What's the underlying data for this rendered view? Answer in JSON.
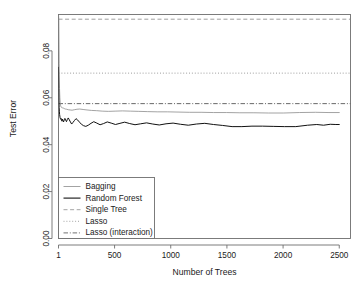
{
  "chart_data": {
    "type": "line",
    "title": "",
    "xlabel": "Number of Trees",
    "ylabel": "Test Error",
    "xlim": [
      1,
      2600
    ],
    "ylim": [
      0.0,
      0.0955
    ],
    "grid": false,
    "legend_position": "bottom-left",
    "xticks": [
      1,
      500,
      1000,
      1500,
      2000,
      2500
    ],
    "xticklabels": [
      "1",
      "500",
      "1000",
      "1500",
      "2000",
      "2500"
    ],
    "yticks": [
      0.0,
      0.02,
      0.04,
      0.06,
      0.08
    ],
    "yticklabels": [
      "0.00",
      "0.02",
      "0.04",
      "0.06",
      "0.08"
    ],
    "series": [
      {
        "name": "Bagging",
        "style": "solid",
        "color": "#8c8c8c",
        "linewidth": 0.8,
        "x": [
          1,
          4,
          7,
          10,
          13,
          16,
          20,
          25,
          30,
          36,
          44,
          52,
          62,
          74,
          88,
          104,
          122,
          142,
          165,
          190,
          220,
          255,
          295,
          340,
          390,
          445,
          505,
          570,
          640,
          715,
          795,
          880,
          970,
          1065,
          1165,
          1270,
          1380,
          1495,
          1615,
          1740,
          1870,
          2005,
          2145,
          2290,
          2400,
          2500
        ],
        "y": [
          0.0955,
          0.0932,
          0.0745,
          0.064,
          0.06,
          0.0578,
          0.0566,
          0.056,
          0.0558,
          0.0557,
          0.0556,
          0.0554,
          0.0552,
          0.0551,
          0.0549,
          0.0548,
          0.0547,
          0.0549,
          0.0551,
          0.0552,
          0.055,
          0.0548,
          0.0546,
          0.0545,
          0.0543,
          0.0542,
          0.0543,
          0.0544,
          0.0543,
          0.0542,
          0.0541,
          0.054,
          0.054,
          0.0539,
          0.0538,
          0.0538,
          0.0537,
          0.0537,
          0.0536,
          0.0536,
          0.0535,
          0.0535,
          0.0537,
          0.0538,
          0.0537,
          0.0537
        ]
      },
      {
        "name": "Random Forest",
        "style": "solid",
        "color": "#111111",
        "linewidth": 1.0,
        "x": [
          1,
          3,
          5,
          7,
          9,
          11,
          13,
          15,
          18,
          21,
          24,
          28,
          32,
          36,
          41,
          46,
          52,
          58,
          65,
          72,
          80,
          88,
          97,
          107,
          118,
          130,
          143,
          157,
          172,
          188,
          205,
          224,
          244,
          266,
          290,
          315,
          342,
          371,
          402,
          435,
          470,
          508,
          548,
          590,
          635,
          682,
          732,
          785,
          840,
          898,
          958,
          1021,
          1087,
          1156,
          1228,
          1303,
          1381,
          1462,
          1546,
          1633,
          1723,
          1816,
          1912,
          2011,
          2113,
          2218,
          2300,
          2360,
          2420,
          2470,
          2500
        ],
        "y": [
          0.073,
          0.064,
          0.059,
          0.0558,
          0.054,
          0.0528,
          0.0522,
          0.0515,
          0.0511,
          0.0508,
          0.0512,
          0.0506,
          0.05,
          0.0509,
          0.0503,
          0.0497,
          0.0506,
          0.0512,
          0.0504,
          0.0498,
          0.0508,
          0.0514,
          0.0506,
          0.0497,
          0.0488,
          0.0495,
          0.0503,
          0.0511,
          0.0505,
          0.0496,
          0.0487,
          0.0481,
          0.0478,
          0.0483,
          0.0491,
          0.0498,
          0.0492,
          0.0485,
          0.049,
          0.0497,
          0.0492,
          0.0486,
          0.0491,
          0.0496,
          0.049,
          0.0485,
          0.0489,
          0.0493,
          0.0488,
          0.0484,
          0.0489,
          0.0492,
          0.0487,
          0.0483,
          0.0488,
          0.0491,
          0.0486,
          0.0482,
          0.0477,
          0.0477,
          0.0479,
          0.0479,
          0.0478,
          0.0477,
          0.0477,
          0.0483,
          0.0486,
          0.0483,
          0.0487,
          0.0486,
          0.0486
        ]
      }
    ],
    "reference_lines": [
      {
        "name": "Single Tree",
        "style": "dashed",
        "color": "#8c8c8c",
        "value": 0.0935
      },
      {
        "name": "Lasso",
        "style": "dotted",
        "color": "#8c8c8c",
        "value": 0.0705
      },
      {
        "name": "Lasso (interaction)",
        "style": "dashdot",
        "color": "#4d4d4d",
        "value": 0.0575
      }
    ],
    "legend": [
      {
        "label": "Bagging",
        "style": "solid",
        "color": "#8c8c8c",
        "linewidth": 0.8
      },
      {
        "label": "Random Forest",
        "style": "solid",
        "color": "#111111",
        "linewidth": 1.1
      },
      {
        "label": "Single Tree",
        "style": "dashed",
        "color": "#8c8c8c",
        "linewidth": 0.8
      },
      {
        "label": "Lasso",
        "style": "dotted",
        "color": "#8c8c8c",
        "linewidth": 0.8
      },
      {
        "label": "Lasso (interaction)",
        "style": "dashdot",
        "color": "#4d4d4d",
        "linewidth": 0.8
      }
    ]
  }
}
